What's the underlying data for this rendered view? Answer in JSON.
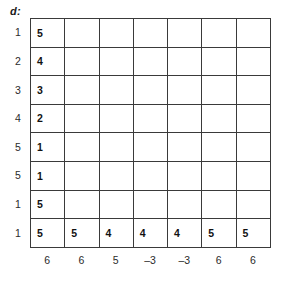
{
  "figure": {
    "caption": "d:",
    "rows": 8,
    "cols": 7
  },
  "row_labels": [
    "1",
    "2",
    "3",
    "4",
    "5",
    "5",
    "1",
    "1"
  ],
  "col_labels": [
    "6",
    "6",
    "5",
    "–3",
    "–3",
    "6",
    "6"
  ],
  "chart_data": {
    "type": "table",
    "title": "d:",
    "xlabel": "",
    "ylabel": "",
    "categories": [
      "6",
      "6",
      "5",
      "–3",
      "–3",
      "6",
      "6"
    ],
    "row_headers": [
      "1",
      "2",
      "3",
      "4",
      "5",
      "5",
      "1",
      "1"
    ],
    "column_headers": [
      "6",
      "6",
      "5",
      "–3",
      "–3",
      "6",
      "6"
    ],
    "cells": [
      [
        "5",
        "",
        "",
        "",
        "",
        "",
        ""
      ],
      [
        "4",
        "",
        "",
        "",
        "",
        "",
        ""
      ],
      [
        "3",
        "",
        "",
        "",
        "",
        "",
        ""
      ],
      [
        "2",
        "",
        "",
        "",
        "",
        "",
        ""
      ],
      [
        "1",
        "",
        "",
        "",
        "",
        "",
        ""
      ],
      [
        "1",
        "",
        "",
        "",
        "",
        "",
        ""
      ],
      [
        "5",
        "",
        "",
        "",
        "",
        "",
        ""
      ],
      [
        "5",
        "5",
        "4",
        "4",
        "4",
        "5",
        "5"
      ]
    ],
    "filled_first_column": [
      "5",
      "4",
      "3",
      "2",
      "1",
      "1",
      "5",
      "5"
    ],
    "filled_last_row": [
      "5",
      "5",
      "4",
      "4",
      "4",
      "5",
      "5"
    ],
    "grid": true,
    "legend": "none"
  }
}
